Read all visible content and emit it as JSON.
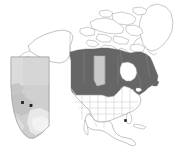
{
  "figure": {
    "type": "map",
    "title": "",
    "width": 176,
    "height": 149,
    "background_color": "#ffffff"
  },
  "colors": {
    "canada_fill": "#666666",
    "highlight_province_fill": "#c9c9c9",
    "other_land_fill": "#ffffff",
    "coastline_stroke": "#9a9a9a",
    "internal_border_stroke": "#b0b0b0",
    "inset_fill": "#cfcfcf",
    "inset_shading_light": "#dddddd",
    "inset_shading_pale": "#eeeeee",
    "inset_stroke": "#aaaaaa",
    "marker_color": "#1a1a1a",
    "background": "#ffffff"
  },
  "main_map": {
    "name": "north-america-locator-map",
    "regions": [
      {
        "name": "Canada",
        "fill_key": "canada_fill",
        "shaded": true
      },
      {
        "name": "Alberta",
        "fill_key": "highlight_province_fill",
        "shaded": true,
        "highlighted": true
      },
      {
        "name": "United States",
        "fill_key": "other_land_fill",
        "shaded": false
      },
      {
        "name": "Alaska",
        "fill_key": "other_land_fill",
        "shaded": false
      },
      {
        "name": "Mexico",
        "fill_key": "other_land_fill",
        "shaded": false
      },
      {
        "name": "Central America",
        "fill_key": "other_land_fill",
        "shaded": false
      },
      {
        "name": "Greenland",
        "fill_key": "other_land_fill",
        "shaded": false
      },
      {
        "name": "Arctic Archipelago",
        "fill_key": "other_land_fill",
        "shaded": false
      },
      {
        "name": "Cuba",
        "fill_key": "other_land_fill",
        "shaded": false
      }
    ],
    "markers": [
      {
        "name": "site-marker-main-map",
        "x": 125.5,
        "y": 120.5,
        "shape": "square",
        "size": 2.6
      }
    ]
  },
  "inset_map": {
    "name": "alberta-inset-map",
    "region": "Alberta",
    "bounds": {
      "x": 9,
      "y": 57,
      "width": 40,
      "height": 81
    },
    "markers": [
      {
        "name": "site-marker-inset-west",
        "x": 22.5,
        "y": 102.5,
        "shape": "square",
        "size": 2.8
      },
      {
        "name": "site-marker-inset-east",
        "x": 31.0,
        "y": 105.5,
        "shape": "square",
        "size": 2.8
      }
    ]
  },
  "labels": []
}
